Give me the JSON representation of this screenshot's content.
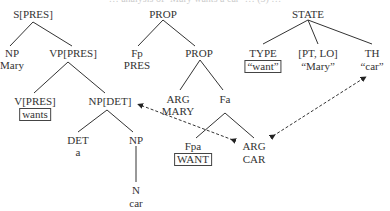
{
  "caption_fragment": "… analysis of ‘Mary wants a car’ … (3) …",
  "syntax_tree": {
    "root": "S[PRES]",
    "np": "NP",
    "np_word": "Mary",
    "vp": "VP[PRES]",
    "v": "V[PRES]",
    "v_word": "wants",
    "np_det": "NP[DET]",
    "det": "DET",
    "det_word": "a",
    "np2": "NP",
    "n": "N",
    "n_word": "car"
  },
  "semantic_tree": {
    "root": "PROP",
    "fp": "Fp",
    "fp_word": "PRES",
    "prop2": "PROP",
    "arg1": "ARG",
    "arg1_word": "MARY",
    "fa": "Fa",
    "fpa": "Fpa",
    "fpa_word": "WANT",
    "arg2": "ARG",
    "arg2_word": "CAR"
  },
  "conceptual_tree": {
    "root": "STATE",
    "type": "TYPE",
    "type_word": "“want”",
    "ptlo": "[PT, LO]",
    "ptlo_word": "“Mary”",
    "th": "TH",
    "th_word": "“car”"
  },
  "links": [
    {
      "from": "ARG CAR",
      "to": "NP[DET]",
      "style": "dashed",
      "arrows": "both"
    },
    {
      "from": "ARG CAR",
      "to": "TH “car”",
      "style": "dashed",
      "arrows": "both"
    }
  ]
}
